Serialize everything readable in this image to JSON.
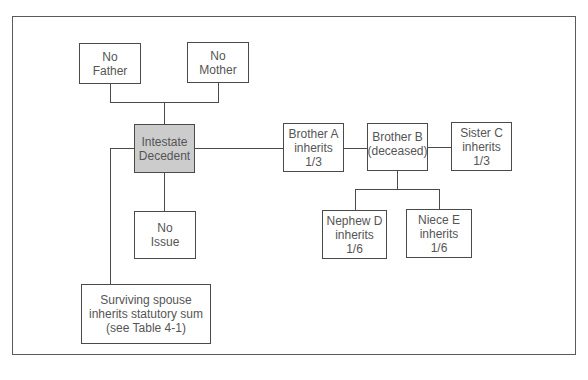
{
  "diagram": {
    "type": "intestate-succession-tree",
    "nodes": {
      "father": {
        "lines": [
          "No",
          "Father"
        ]
      },
      "mother": {
        "lines": [
          "No",
          "Mother"
        ]
      },
      "decedent": {
        "lines": [
          "Intestate",
          "Decedent"
        ],
        "fill": "#cccccc"
      },
      "issue": {
        "lines": [
          "No",
          "Issue"
        ]
      },
      "spouse": {
        "lines": [
          "Surviving spouse",
          "inherits statutory sum",
          "(see Table 4-1)"
        ]
      },
      "brother_a": {
        "lines": [
          "Brother A",
          "inherits",
          "1/3"
        ]
      },
      "brother_b": {
        "lines": [
          "Brother B",
          "(deceased)"
        ]
      },
      "sister_c": {
        "lines": [
          "Sister C",
          "inherits",
          "1/3"
        ]
      },
      "nephew_d": {
        "lines": [
          "Nephew D",
          "inherits",
          "1/6"
        ]
      },
      "niece_e": {
        "lines": [
          "Niece E",
          "inherits",
          "1/6"
        ]
      }
    },
    "edges": [
      [
        "father",
        "decedent"
      ],
      [
        "mother",
        "decedent"
      ],
      [
        "decedent",
        "issue"
      ],
      [
        "decedent",
        "spouse"
      ],
      [
        "decedent",
        "brother_a"
      ],
      [
        "brother_a",
        "brother_b"
      ],
      [
        "brother_b",
        "sister_c"
      ],
      [
        "brother_b",
        "nephew_d"
      ],
      [
        "brother_b",
        "niece_e"
      ]
    ]
  }
}
